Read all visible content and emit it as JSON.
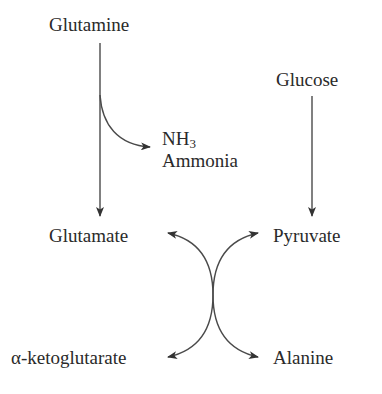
{
  "diagram": {
    "nodes": {
      "glutamine": "Glutamine",
      "glucose": "Glucose",
      "nh3_formula": "NH",
      "nh3_subscript": "3",
      "ammonia": "Ammonia",
      "glutamate": "Glutamate",
      "pyruvate": "Pyruvate",
      "alpha_ketoglutarate": "α-ketoglutarate",
      "alanine": "Alanine"
    },
    "edges": [
      {
        "from": "Glutamine",
        "to": "Glutamate",
        "type": "straight-arrow"
      },
      {
        "from": "Glutamine",
        "to": "NH3 Ammonia",
        "type": "branch-arrow"
      },
      {
        "from": "Glucose",
        "to": "Pyruvate",
        "type": "straight-arrow"
      },
      {
        "from": "Alanine",
        "to": "Glutamate",
        "type": "curved-arrow",
        "note": "transamination (crossing arrows)"
      },
      {
        "from": "α-ketoglutarate",
        "to": "Pyruvate",
        "type": "curved-arrow",
        "note": "transamination (crossing arrows)"
      }
    ],
    "colors": {
      "text": "#2a2a2a",
      "line": "#4a4a4a",
      "background": "#ffffff"
    }
  }
}
